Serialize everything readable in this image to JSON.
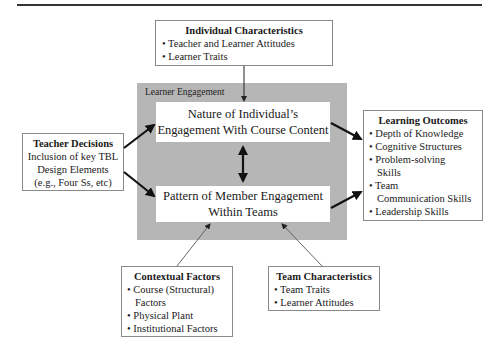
{
  "diagram": {
    "individual_characteristics": {
      "title": "Individual Characteristics",
      "items": [
        "• Teacher and Learner Attitudes",
        "• Learner Traits"
      ]
    },
    "learner_engagement": {
      "label": "Learner Engagement",
      "top_box": [
        "Nature of Individual’s",
        "Engagement With Course Content"
      ],
      "bottom_box": [
        "Pattern of Member Engagement",
        "Within Teams"
      ]
    },
    "teacher_decisions": {
      "title": "Teacher Decisions",
      "lines": [
        "Inclusion of key TBL",
        "Design Elements",
        "(e.g., Four Ss, etc)"
      ]
    },
    "learning_outcomes": {
      "title": "Learning Outcomes",
      "items": [
        "• Depth of Knowledge",
        "• Cognitive Structures",
        "• Problem-solving",
        "Skills",
        "• Team",
        "Communication Skills",
        "• Leadership Skills"
      ]
    },
    "contextual_factors": {
      "title": "Contextual Factors",
      "items": [
        "• Course (Structural)",
        "Factors",
        "• Physical Plant",
        "• Institutional Factors"
      ]
    },
    "team_characteristics": {
      "title": "Team Characteristics",
      "items": [
        "• Team Traits",
        "• Learner Attitudes"
      ]
    },
    "colors": {
      "engagement_background": "#b6b6b6",
      "box_border": "#8a8a8a",
      "arrow": "#111111"
    }
  }
}
